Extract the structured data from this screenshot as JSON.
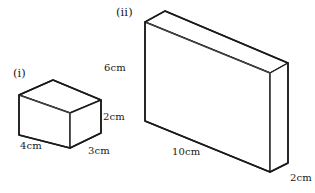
{
  "figure": {
    "background_color": "#ffffff",
    "stroke_color": "#1a1a1a",
    "inner_stroke_color": "#555555",
    "width_px": 315,
    "height_px": 193
  },
  "shapes": [
    {
      "tag": "(i)",
      "name": "small-cuboid",
      "dimensions": {
        "height": "2cm",
        "width": "4cm",
        "depth": "3cm"
      }
    },
    {
      "tag": "(ii)",
      "name": "large-cuboid",
      "dimensions": {
        "height": "6cm",
        "width": "10cm",
        "depth": "2cm"
      }
    }
  ],
  "labels": {
    "fig_i_tag": "(i)",
    "fig_i_height": "2cm",
    "fig_i_width": "4cm",
    "fig_i_depth": "3cm",
    "fig_ii_tag": "(ii)",
    "fig_ii_height": "6cm",
    "fig_ii_width": "10cm",
    "fig_ii_depth": "2cm"
  }
}
